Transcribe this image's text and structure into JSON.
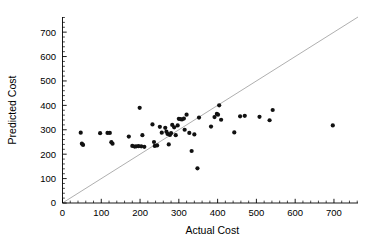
{
  "chart_data": {
    "type": "scatter",
    "title": "",
    "xlabel": "Actual Cost",
    "ylabel": "Predicted Cost",
    "xlim": [
      0,
      762
    ],
    "ylim": [
      0,
      762
    ],
    "grid": false,
    "legend": null,
    "xticks": [
      0,
      100,
      200,
      300,
      400,
      500,
      600,
      700
    ],
    "yticks": [
      0,
      100,
      200,
      300,
      400,
      500,
      600,
      700
    ],
    "xtick_labels": [
      "0",
      "100",
      "200",
      "300",
      "400",
      "500",
      "600",
      "700"
    ],
    "ytick_labels": [
      "0",
      "100",
      "200",
      "300",
      "400",
      "500",
      "600",
      "700"
    ],
    "minor_tick_interval": 20,
    "reference_line": {
      "name": "identity-line",
      "description": "y = x diagonal reference line",
      "from": [
        0,
        0
      ],
      "to": [
        762,
        762
      ],
      "color": "#9a9a9a"
    },
    "marker": {
      "shape": "circle",
      "color": "#111111",
      "size": 2.1
    },
    "series": [
      {
        "name": "Cost estimates",
        "points": [
          [
            47,
            288
          ],
          [
            50,
            243
          ],
          [
            53,
            238
          ],
          [
            97,
            286
          ],
          [
            116,
            287
          ],
          [
            122,
            287
          ],
          [
            126,
            249
          ],
          [
            129,
            243
          ],
          [
            171,
            272
          ],
          [
            180,
            234
          ],
          [
            186,
            231
          ],
          [
            190,
            232
          ],
          [
            196,
            233
          ],
          [
            199,
            390
          ],
          [
            203,
            232
          ],
          [
            206,
            278
          ],
          [
            211,
            230
          ],
          [
            232,
            322
          ],
          [
            236,
            250
          ],
          [
            238,
            234
          ],
          [
            244,
            236
          ],
          [
            251,
            312
          ],
          [
            256,
            288
          ],
          [
            265,
            308
          ],
          [
            268,
            292
          ],
          [
            271,
            283
          ],
          [
            274,
            240
          ],
          [
            277,
            279
          ],
          [
            280,
            286
          ],
          [
            283,
            320
          ],
          [
            288,
            310
          ],
          [
            292,
            278
          ],
          [
            297,
            318
          ],
          [
            300,
            345
          ],
          [
            304,
            344
          ],
          [
            308,
            342
          ],
          [
            313,
            346
          ],
          [
            315,
            300
          ],
          [
            320,
            362
          ],
          [
            327,
            287
          ],
          [
            333,
            213
          ],
          [
            340,
            281
          ],
          [
            348,
            142
          ],
          [
            352,
            350
          ],
          [
            383,
            313
          ],
          [
            392,
            352
          ],
          [
            398,
            365
          ],
          [
            401,
            362
          ],
          [
            404,
            400
          ],
          [
            409,
            341
          ],
          [
            443,
            289
          ],
          [
            458,
            355
          ],
          [
            470,
            357
          ],
          [
            508,
            353
          ],
          [
            534,
            339
          ],
          [
            542,
            381
          ],
          [
            697,
            318
          ]
        ]
      }
    ]
  },
  "axes": {
    "x_axis_name": "x-axis",
    "y_axis_name": "y-axis"
  }
}
